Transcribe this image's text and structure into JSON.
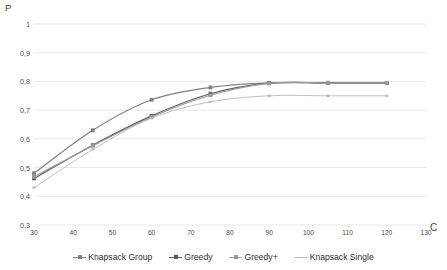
{
  "chart_data": {
    "type": "line",
    "title": "",
    "xlabel": "C",
    "ylabel": "P",
    "xlim": [
      30,
      130
    ],
    "ylim": [
      0.3,
      1.0
    ],
    "xticks": [
      "30",
      "40",
      "50",
      "60",
      "70",
      "80",
      "90",
      "100",
      "110",
      "120",
      "130"
    ],
    "xtick_values": [
      30,
      40,
      50,
      60,
      70,
      80,
      90,
      100,
      110,
      120,
      130
    ],
    "yticks": [
      "0,3",
      "0,4",
      "0,5",
      "0,6",
      "0,7",
      "0,8",
      "0,9",
      "1"
    ],
    "ytick_values": [
      0.3,
      0.4,
      0.5,
      0.6,
      0.7,
      0.8,
      0.9,
      1.0
    ],
    "grid": "horizontal",
    "legend_position": "bottom",
    "x": [
      30,
      45,
      60,
      75,
      90,
      105,
      120
    ],
    "series": [
      {
        "name": "Knapsack Group",
        "color": "#808080",
        "marker": "square",
        "values": [
          0.48,
          0.63,
          0.736,
          0.779,
          0.795,
          0.795,
          0.795
        ]
      },
      {
        "name": "Greedy",
        "color": "#5a5a5a",
        "marker": "square",
        "values": [
          0.462,
          0.578,
          0.68,
          0.757,
          0.794,
          0.795,
          0.795
        ]
      },
      {
        "name": "Greedy+",
        "color": "#9a9a9a",
        "marker": "square",
        "values": [
          0.468,
          0.576,
          0.676,
          0.752,
          0.793,
          0.795,
          0.795
        ]
      },
      {
        "name": "Knapsack Single",
        "color": "#b8b8b8",
        "marker": "dash",
        "values": [
          0.43,
          0.563,
          0.672,
          0.729,
          0.75,
          0.75,
          0.75
        ]
      }
    ]
  },
  "axis_labels": {
    "y": "P",
    "x": "C"
  },
  "colors": {
    "gridline": "#e8e8e8",
    "text": "#4a4a4a",
    "background": "#ffffff"
  }
}
